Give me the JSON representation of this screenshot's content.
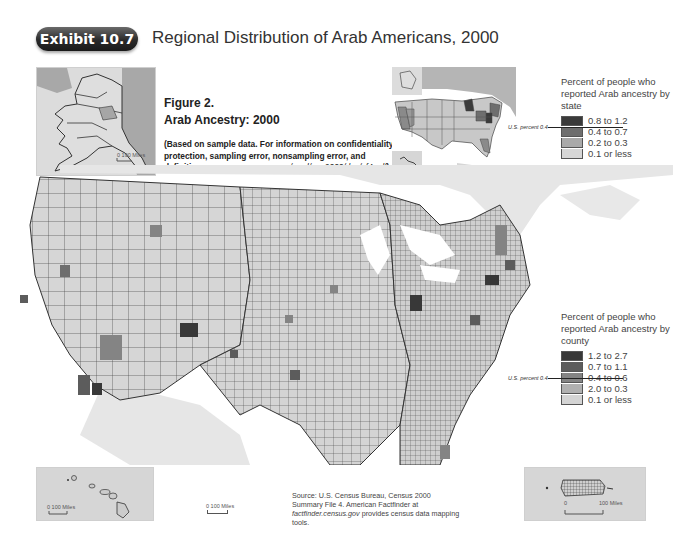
{
  "header": {
    "exhibit_label": "Exhibit 10.7",
    "title": "Regional Distribution of Arab Americans, 2000"
  },
  "figure": {
    "number": "Figure 2.",
    "title": "Arab Ancestry: 2000",
    "note_prefix": "(Based on sample data. For information on confidentiality protection, sampling error, nonsampling error, and definitions, see ",
    "note_url": "www.census.gov/prod/cen2000/doc/sf4.pdf",
    "note_suffix": ")"
  },
  "legend_state": {
    "heading": "Percent of people who reported Arab ancestry by state",
    "us_percent_label": "U.S. percent 0.4",
    "classes": [
      {
        "label": "0.8 to 1.2",
        "color": "#3a3a3a"
      },
      {
        "label": "0.4 to 0.7",
        "color": "#6e6e6e"
      },
      {
        "label": "0.2 to 0.3",
        "color": "#a9a9a9"
      },
      {
        "label": "0.1 or less",
        "color": "#d6d6d6"
      }
    ]
  },
  "legend_county": {
    "heading": "Percent of people who reported Arab ancestry by county",
    "us_percent_label": "U.S. percent 0.4",
    "classes": [
      {
        "label": "1.2 to 2.7",
        "color": "#383838"
      },
      {
        "label": "0.7 to 1.1",
        "color": "#5c5c5c"
      },
      {
        "label": "0.4 to 0.6",
        "color": "#848484"
      },
      {
        "label": "2.0 to 0.3",
        "color": "#b0b0b0"
      },
      {
        "label": "0.1 or less",
        "color": "#d4d4d4"
      }
    ]
  },
  "insets": {
    "alaska_scale": "0  100 Miles",
    "hawaii_scale": "0      100 Miles",
    "main_scale": "0      100 Miles",
    "puerto_rico_scale_start": "0",
    "puerto_rico_scale_end": "100 Miles"
  },
  "source": {
    "text_prefix": "Source: U.S. Census Bureau, Census 2000 Summary File 4. American Factfinder at ",
    "url": "factfinder.census.gov",
    "text_suffix": " provides census data mapping tools."
  }
}
